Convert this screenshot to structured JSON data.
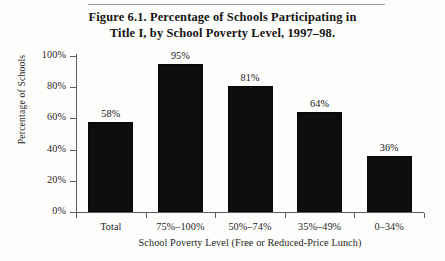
{
  "figure": {
    "caption_line1": "Figure 6.1.  Percentage of Schools Participating in",
    "caption_line2": "Title I, by School Poverty Level, 1997–98."
  },
  "chart_data": {
    "type": "bar",
    "title": "Figure 6.1.  Percentage of Schools Participating in Title I, by School Poverty Level, 1997–98.",
    "categories": [
      "Total",
      "75%–100%",
      "50%–74%",
      "35%–49%",
      "0–34%"
    ],
    "values": [
      58,
      95,
      81,
      64,
      36
    ],
    "value_labels": [
      "58%",
      "95%",
      "81%",
      "64%",
      "36%"
    ],
    "xlabel": "School Poverty Level (Free or Reduced-Price Lunch)",
    "ylabel": "Percentage of Schools",
    "ylim": [
      0,
      100
    ],
    "yticks": [
      0,
      20,
      40,
      60,
      80,
      100
    ],
    "ytick_labels": [
      "0%",
      "20%",
      "40%",
      "60%",
      "80%",
      "100%"
    ],
    "grid": false,
    "legend": "none",
    "bar_color": "#0d0d0d",
    "background_color": "#fdfdfb"
  }
}
